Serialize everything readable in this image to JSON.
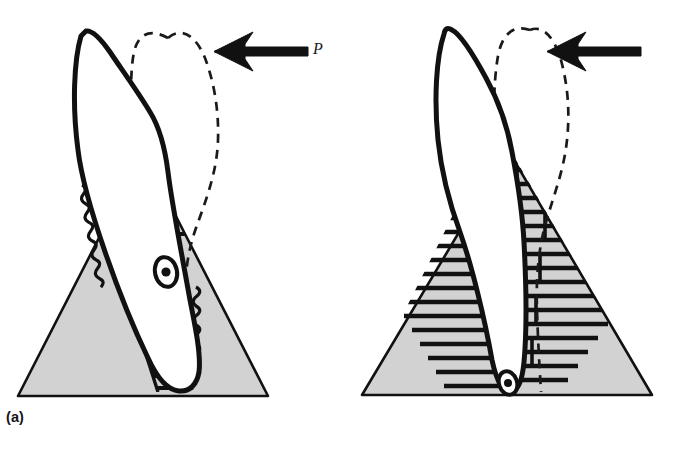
{
  "figure": {
    "background_color": "#ffffff",
    "width": 673,
    "height": 464,
    "ink_color": "#111111",
    "bone_fill_color": "#d2d2d2",
    "tooth_fill_color": "#ffffff"
  },
  "panels": [
    {
      "id": "a",
      "label": "(a)",
      "movement_type": "tipping",
      "force": {
        "label": "P",
        "direction": "left",
        "arrow_name": "force-arrow"
      },
      "tooth": {
        "original_outline": "solid",
        "displaced_outline": "dashed",
        "rotation_center": {
          "present": true,
          "location": "mid-root",
          "marker": "ringed-dot",
          "x": 166,
          "y": 272
        }
      },
      "stress_zones": [
        {
          "name": "compression-upper-left",
          "style": "scalloped",
          "side": "left",
          "region": "cervical"
        },
        {
          "name": "tension-upper-right",
          "style": "horizontal-hatch",
          "side": "right",
          "region": "cervical"
        },
        {
          "name": "tension-lower-left",
          "style": "horizontal-hatch",
          "side": "left",
          "region": "apical"
        },
        {
          "name": "compression-lower-right",
          "style": "scalloped",
          "side": "right",
          "region": "apical"
        }
      ],
      "bone": {
        "shape": "triangle",
        "fill": "#d2d2d2"
      }
    },
    {
      "id": "b",
      "label": "(b)",
      "movement_type": "bodily-translation",
      "force": {
        "label": "P",
        "direction": "left",
        "arrow_name": "force-arrow"
      },
      "tooth": {
        "original_outline": "solid",
        "displaced_outline": "dashed",
        "rotation_center": {
          "present": true,
          "location": "root-apex",
          "marker": "ringed-dot",
          "x": 508,
          "y": 383
        }
      },
      "stress_zones": [
        {
          "name": "uniform-hatch-left",
          "style": "horizontal-hatch",
          "side": "left",
          "region": "full-root"
        },
        {
          "name": "uniform-hatch-right",
          "style": "horizontal-hatch",
          "side": "right",
          "region": "full-root"
        }
      ],
      "bone": {
        "shape": "triangle",
        "fill": "#d2d2d2"
      }
    }
  ]
}
